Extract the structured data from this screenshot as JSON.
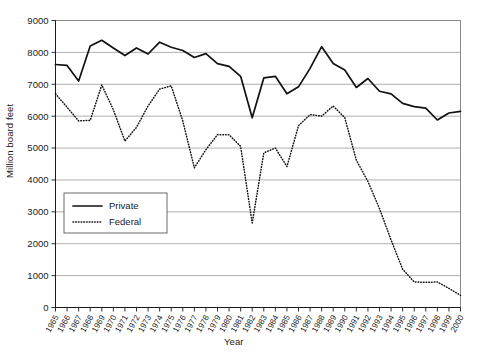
{
  "chart_data": {
    "type": "line",
    "title": "",
    "xlabel": "Year",
    "ylabel": "Million board feet",
    "xlim": [
      1965,
      2000
    ],
    "ylim": [
      0,
      9000
    ],
    "grid": true,
    "legend_position": "center-left",
    "x": [
      1965,
      1966,
      1967,
      1968,
      1969,
      1970,
      1971,
      1972,
      1973,
      1974,
      1975,
      1976,
      1977,
      1978,
      1979,
      1980,
      1981,
      1982,
      1983,
      1984,
      1985,
      1986,
      1987,
      1988,
      1989,
      1990,
      1991,
      1992,
      1993,
      1994,
      1995,
      1996,
      1997,
      1998,
      1999,
      2000
    ],
    "categories": [
      "1965",
      "1966",
      "1967",
      "1968",
      "1969",
      "1970",
      "1971",
      "1972",
      "1973",
      "1974",
      "1975",
      "1976",
      "1977",
      "1978",
      "1979",
      "1980",
      "1981",
      "1982",
      "1983",
      "1984",
      "1985",
      "1986",
      "1987",
      "1988",
      "1989",
      "1990",
      "1991",
      "1992",
      "1993",
      "1994",
      "1995",
      "1996",
      "1997",
      "1998",
      "1999",
      "2000"
    ],
    "ytick_labels": [
      "9000",
      "8000",
      "7000",
      "6000",
      "5000",
      "4000",
      "3000",
      "2000",
      "1000",
      "0"
    ],
    "ytick_values": [
      9000,
      8000,
      7000,
      6000,
      5000,
      4000,
      3000,
      2000,
      1000,
      0
    ],
    "series": [
      {
        "name": "Private",
        "style": "solid",
        "color": "#111111",
        "values": [
          7620,
          7590,
          7100,
          8200,
          8380,
          8140,
          7900,
          8140,
          7950,
          8320,
          8160,
          8060,
          7840,
          7960,
          7650,
          7560,
          7250,
          5950,
          7200,
          7250,
          6700,
          6920,
          7500,
          8180,
          7650,
          7450,
          6900,
          7180,
          6780,
          6700,
          6400,
          6300,
          6250,
          5880,
          6100,
          6150
        ]
      },
      {
        "name": "Federal",
        "style": "dotted",
        "color": "#111111",
        "values": [
          6700,
          6280,
          5850,
          5870,
          6980,
          6200,
          5220,
          5650,
          6320,
          6850,
          6950,
          5850,
          4380,
          4950,
          5420,
          5420,
          5050,
          2650,
          4850,
          5000,
          4420,
          5700,
          6050,
          6000,
          6320,
          5950,
          4620,
          3950,
          3100,
          2120,
          1200,
          800,
          790,
          800,
          600,
          380
        ]
      }
    ]
  },
  "legend": {
    "items": [
      {
        "label": "Private",
        "style": "solid"
      },
      {
        "label": "Federal",
        "style": "dotted"
      }
    ]
  }
}
